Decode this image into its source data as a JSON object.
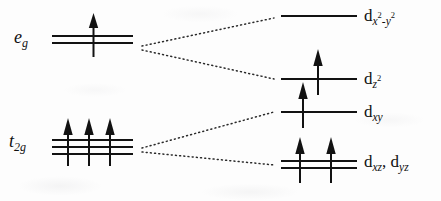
{
  "diagram": {
    "type": "energy-level-diagram",
    "background_color": "#fdfdfd",
    "ink_color": "#121212"
  },
  "left_levels": [
    {
      "id": "eg",
      "label_main": "e",
      "label_sub": "g",
      "label_full": "e_g",
      "degeneracy": 2,
      "line_count": 2,
      "electrons": 1,
      "arrows": [
        "up"
      ],
      "line_y": [
        36,
        43
      ],
      "line_x_start": 52,
      "line_x_end": 133,
      "label_x": 14,
      "label_y": 30
    },
    {
      "id": "t2g",
      "label_main": "t",
      "label_sub": "2g",
      "label_full": "t_2g",
      "degeneracy": 3,
      "line_count": 3,
      "electrons": 3,
      "arrows": [
        "up",
        "up",
        "up"
      ],
      "line_y": [
        140,
        147,
        154
      ],
      "line_x_start": 52,
      "line_x_end": 133,
      "label_x": 9,
      "label_y": 134
    }
  ],
  "right_levels": [
    {
      "id": "dx2y2",
      "label_d": "d",
      "label_sub": "x",
      "label_sup1": "2",
      "label_mid": "-y",
      "label_sup2": "2",
      "label_full": "d_x2-y2",
      "line_count": 1,
      "electrons": 0,
      "arrows": [],
      "line_y": [
        16
      ],
      "line_x_start": 281,
      "line_x_end": 357,
      "label_x": 364,
      "label_y": 8
    },
    {
      "id": "dz2",
      "label_d": "d",
      "label_sub": "z",
      "label_sup1": "2",
      "label_full": "d_z2",
      "line_count": 1,
      "electrons": 1,
      "arrows": [
        "up"
      ],
      "line_y": [
        79
      ],
      "line_x_start": 281,
      "line_x_end": 357,
      "label_x": 364,
      "label_y": 70
    },
    {
      "id": "dxy",
      "label_d": "d",
      "label_sub": "xy",
      "label_full": "d_xy",
      "line_count": 1,
      "electrons": 1,
      "arrows": [
        "up"
      ],
      "line_y": [
        112
      ],
      "line_x_start": 281,
      "line_x_end": 357,
      "label_x": 364,
      "label_y": 103
    },
    {
      "id": "dxz_dyz",
      "label_d": "d",
      "label_sub": "xz",
      "label_sep": ", ",
      "label_d2": "d",
      "label_sub2": "yz",
      "label_full": "d_xz, d_yz",
      "line_count": 2,
      "electrons": 2,
      "arrows": [
        "up",
        "up"
      ],
      "line_y": [
        161,
        168
      ],
      "line_x_start": 281,
      "line_x_end": 357,
      "label_x": 364,
      "label_y": 155
    }
  ],
  "correlation_lines": [
    {
      "from": "eg",
      "to": "dx2y2",
      "x1": 142,
      "y1": 46,
      "x2": 274,
      "y2": 18
    },
    {
      "from": "eg",
      "to": "dz2",
      "x1": 142,
      "y1": 50,
      "x2": 274,
      "y2": 79
    },
    {
      "from": "t2g",
      "to": "dxy",
      "x1": 142,
      "y1": 148,
      "x2": 274,
      "y2": 112
    },
    {
      "from": "t2g",
      "to": "dxz_dyz",
      "x1": 142,
      "y1": 152,
      "x2": 274,
      "y2": 165
    }
  ]
}
